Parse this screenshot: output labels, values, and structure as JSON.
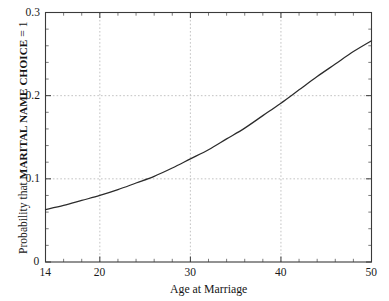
{
  "chart_data": {
    "type": "line",
    "title": "",
    "subtitle": "",
    "xlabel": "Age at Marriage",
    "ylabel_full": "Probability that MARITAL NAME CHOICE = 1",
    "ylabel_prefix": "Probability that ",
    "ylabel_caps": "MARITAL NAME CHOICE",
    "ylabel_suffix": " = 1",
    "xlim": [
      14,
      50
    ],
    "ylim": [
      0,
      0.3
    ],
    "grid": true,
    "grid_style": "dotted",
    "grid_color": "#b4b4b4",
    "legend": "none",
    "line_color": "#2b2b2b",
    "background": "#ffffff",
    "axis_color": "#3a3a3a",
    "xticks_major": [
      14,
      20,
      30,
      40,
      50
    ],
    "xticks_major_labels": [
      "14",
      "20",
      "30",
      "40",
      "50"
    ],
    "xticks_minor": [
      16,
      18,
      22,
      24,
      26,
      28,
      32,
      34,
      36,
      38,
      42,
      44,
      46,
      48
    ],
    "yticks_major": [
      0,
      0.1,
      0.2,
      0.3
    ],
    "yticks_major_labels": [
      "0",
      "0.1",
      "0.2",
      "0.3"
    ],
    "yticks_minor": [
      0.02,
      0.04,
      0.06,
      0.08,
      0.12,
      0.14,
      0.16,
      0.18,
      0.22,
      0.24,
      0.26,
      0.28
    ],
    "xgridlines": [
      20,
      30,
      40
    ],
    "ygridlines": [
      0.1,
      0.2
    ],
    "series": [
      {
        "name": "Predicted probability",
        "x": [
          14,
          16,
          18,
          20,
          22,
          24,
          26,
          28,
          30,
          32,
          34,
          36,
          38,
          40,
          42,
          44,
          46,
          48,
          50
        ],
        "y": [
          0.063,
          0.068,
          0.074,
          0.08,
          0.087,
          0.095,
          0.103,
          0.113,
          0.124,
          0.135,
          0.148,
          0.161,
          0.176,
          0.191,
          0.207,
          0.223,
          0.238,
          0.253,
          0.266
        ]
      }
    ]
  }
}
